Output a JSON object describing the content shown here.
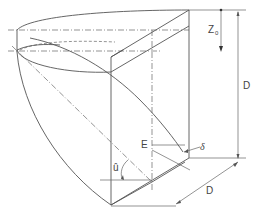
{
  "diagram": {
    "type": "technical-isometric-drawing",
    "labels": {
      "z0": "Z",
      "z0_sub": "0",
      "d_vertical": "D",
      "d_bottom": "D",
      "e": "E",
      "delta": "δ",
      "angle": "û"
    },
    "colors": {
      "line": "#555555",
      "background": "#ffffff"
    }
  }
}
